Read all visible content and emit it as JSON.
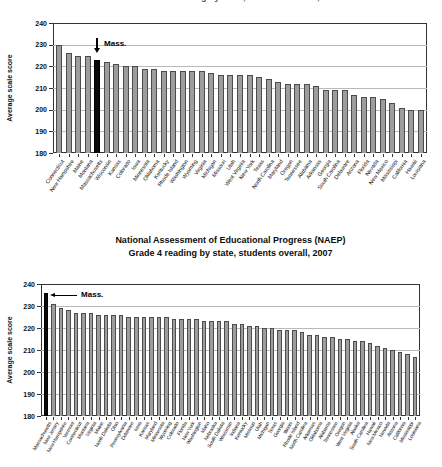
{
  "colors": {
    "bar_fill": "#9d9d9d",
    "bar_border": "#4c4c4c",
    "highlight_bar": "#0a0a0a",
    "gridline": "#b9b9b9",
    "axis_frame": "#333333",
    "text": "#111111"
  },
  "chart_data": [
    {
      "type": "bar",
      "position": "top",
      "title_cropped": true,
      "cropped_title_text": "Grade 4 reading by state, students overall, 1998",
      "ylabel": "Average scale score",
      "ylim": [
        180,
        240
      ],
      "yticks": [
        240,
        230,
        220,
        210,
        200,
        190,
        180
      ],
      "grid": "horizontal",
      "legend": "none",
      "highlight_state": "Massachusetts",
      "annotation_label": "Mass.",
      "annotation_style": "down-arrow",
      "categories": [
        "Connecticut",
        "New Hampshire",
        "Maine",
        "Montana",
        "Massachusetts",
        "Wisconsin",
        "Kansas",
        "Colorado",
        "Iowa",
        "Minnesota",
        "Oklahoma",
        "Kentucky",
        "Rhode Island",
        "Washington",
        "Wyoming",
        "Virginia",
        "Michigan",
        "Missouri",
        "Utah",
        "West Virginia",
        "New York",
        "Texas",
        "North Carolina",
        "Maryland",
        "Oregon",
        "Tennessee",
        "Alabama",
        "Arkansas",
        "Georgia",
        "South Carolina",
        "Delaware",
        "Arizona",
        "Florida",
        "Nevada",
        "New Mexico",
        "Mississippi",
        "California",
        "Hawaii",
        "Louisiana"
      ],
      "values": [
        230,
        226,
        225,
        225,
        223,
        222,
        221,
        220,
        220,
        219,
        219,
        218,
        218,
        218,
        218,
        218,
        217,
        216,
        216,
        216,
        216,
        215,
        214,
        213,
        212,
        212,
        212,
        211,
        209,
        209,
        209,
        207,
        206,
        206,
        205,
        203,
        201,
        200,
        200
      ]
    },
    {
      "type": "bar",
      "position": "bottom",
      "title": "National Assessment of Educational Progress (NAEP)",
      "subtitle": "Grade 4 reading by state, students overall, 2007",
      "ylabel": "Average scale score",
      "ylim": [
        180,
        240
      ],
      "yticks": [
        240,
        230,
        220,
        210,
        200,
        190,
        180
      ],
      "grid": "horizontal",
      "legend": "none",
      "highlight_state": "Massachusetts",
      "annotation_label": "Mass.",
      "annotation_style": "left-arrow",
      "categories": [
        "Massachusetts",
        "New Jersey",
        "New Hampshire",
        "Vermont",
        "Connecticut",
        "Montana",
        "Virginia",
        "Maine",
        "North Dakota",
        "Ohio",
        "Pennsylvania",
        "Delaware",
        "Iowa",
        "Kansas",
        "Maryland",
        "Minnesota",
        "Wyoming",
        "Colorado",
        "Florida",
        "New York",
        "Washington",
        "Idaho",
        "Nebraska",
        "South Dakota",
        "Wisconsin",
        "Indiana",
        "Kentucky",
        "Missouri",
        "Utah",
        "Michigan",
        "Texas",
        "Georgia",
        "Illinois",
        "Rhode Island",
        "North Carolina",
        "Arkansas",
        "Oklahoma",
        "Alabama",
        "Tennessee",
        "Oregon",
        "West Virginia",
        "Alaska",
        "South Carolina",
        "Hawaii",
        "New Mexico",
        "Nevada",
        "Arizona",
        "California",
        "Mississippi",
        "Louisiana"
      ],
      "values": [
        236,
        231,
        229,
        228,
        227,
        227,
        227,
        226,
        226,
        226,
        226,
        225,
        225,
        225,
        225,
        225,
        225,
        224,
        224,
        224,
        224,
        223,
        223,
        223,
        223,
        222,
        222,
        221,
        221,
        220,
        220,
        219,
        219,
        219,
        218,
        217,
        217,
        216,
        216,
        215,
        215,
        214,
        214,
        213,
        212,
        211,
        210,
        209,
        208,
        207
      ]
    }
  ]
}
